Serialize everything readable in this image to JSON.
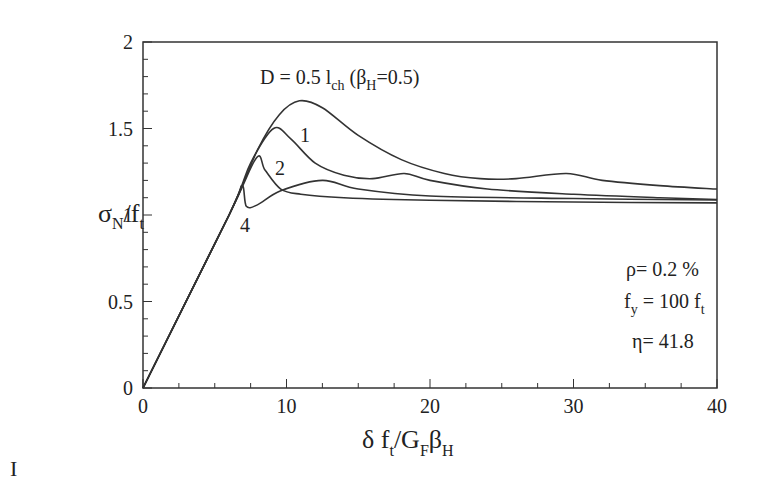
{
  "chart_data": {
    "type": "line",
    "title": "",
    "xlabel": "δ f_t / G_F β_H",
    "ylabel": "σ_N / f_t",
    "xlim": [
      0,
      40
    ],
    "ylim": [
      0,
      2
    ],
    "grid": false,
    "xticks": [
      0,
      10,
      20,
      30,
      40
    ],
    "yticks": [
      0,
      0.5,
      1,
      1.5,
      2
    ],
    "xtick_labels": [
      "0",
      "10",
      "20",
      "30",
      "40"
    ],
    "ytick_labels": [
      "0",
      "0.5",
      "1",
      "1.5",
      "2"
    ],
    "series": [
      {
        "name": "D = 0.5 l_ch (β_H=0.5)",
        "x": [
          0,
          6,
          8,
          9.5,
          10.9,
          12.5,
          15,
          18,
          21,
          23.5,
          26,
          29.5,
          32,
          36,
          40
        ],
        "y": [
          0,
          1.0,
          1.38,
          1.58,
          1.66,
          1.62,
          1.46,
          1.32,
          1.24,
          1.21,
          1.21,
          1.24,
          1.2,
          1.17,
          1.15
        ]
      },
      {
        "name": "1",
        "x": [
          0,
          6,
          7.5,
          9.1,
          10.3,
          12,
          14,
          16,
          18.2,
          20,
          24,
          30,
          36,
          40
        ],
        "y": [
          0,
          1.0,
          1.3,
          1.5,
          1.44,
          1.3,
          1.23,
          1.21,
          1.24,
          1.2,
          1.15,
          1.12,
          1.1,
          1.09
        ]
      },
      {
        "name": "2",
        "x": [
          0,
          6,
          7.9,
          8.5,
          9.6,
          11,
          14,
          20,
          30,
          40
        ],
        "y": [
          0,
          1.0,
          1.33,
          1.26,
          1.15,
          1.12,
          1.1,
          1.085,
          1.075,
          1.07
        ]
      },
      {
        "name": "4",
        "x": [
          0,
          6,
          6.9,
          7.2,
          8,
          9.6,
          12.5,
          15,
          20,
          30,
          40
        ],
        "y": [
          0,
          1.0,
          1.17,
          1.05,
          1.06,
          1.14,
          1.2,
          1.15,
          1.11,
          1.095,
          1.087
        ]
      }
    ],
    "annotations": [
      {
        "text": "D = 0.5 l_ch (β_H=0.5)",
        "x": 10.5,
        "y": 1.78
      },
      {
        "text": "1",
        "x": 11.2,
        "y": 1.42
      },
      {
        "text": "2",
        "x": 9.6,
        "y": 1.28
      },
      {
        "text": "4",
        "x": 7.0,
        "y": 0.95
      },
      {
        "text": "ρ= 0.2 %",
        "x": 35,
        "y": 0.68
      },
      {
        "text": "f_y = 100 f_t",
        "x": 35,
        "y": 0.5
      },
      {
        "text": "η= 41.8",
        "x": 35,
        "y": 0.32
      }
    ]
  },
  "labels": {
    "ylabel_main": "σ",
    "ylabel_sub": "N",
    "ylabel_rest": "/f",
    "ylabel_sub2": "t",
    "xlabel_a": "δ f",
    "xlabel_sub_t": "t",
    "xlabel_b": "/G",
    "xlabel_sub_F": "F",
    "xlabel_c": "β",
    "xlabel_sub_H": "H",
    "title_a": "D = 0.5 l",
    "title_sub_ch": "ch",
    "title_b": " (β",
    "title_sub_H": "H",
    "title_c": "=0.5)",
    "curve1": "1",
    "curve2": "2",
    "curve4": "4",
    "rho": "ρ= 0.2 %",
    "fy_a": "f",
    "fy_sub": "y",
    "fy_b": " = 100 f",
    "fy_sub2": "t",
    "eta": "η= 41.8",
    "stray": "I"
  }
}
